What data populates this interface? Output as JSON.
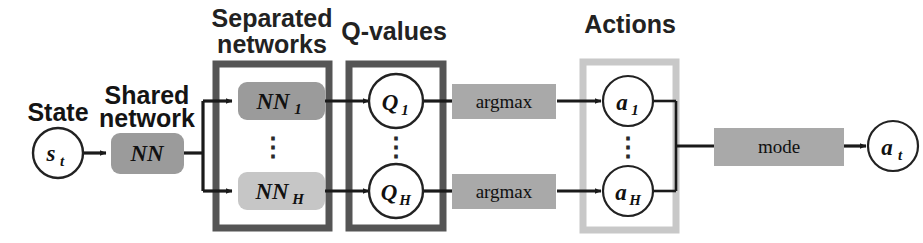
{
  "diagram": {
    "type": "flow-diagram",
    "canvas": {
      "width": 923,
      "height": 243,
      "background": "#ffffff"
    },
    "palette": {
      "ink": "#141414",
      "edge": "#1a1a1a",
      "box_dark_gray": "#9b9b9b",
      "box_light_gray": "#c6c6c6",
      "op_gray": "#a9a9a9",
      "mode_gray": "#a9a9a9",
      "group_border_dark": "#555555",
      "group_border_light": "#c8c8c8",
      "circle_fill": "#ffffff",
      "circle_stroke": "#222222"
    },
    "stage_labels": {
      "state": "State",
      "shared_network": "Shared\nnetwork",
      "shared_network_line1": "Shared",
      "shared_network_line2": "network"
    },
    "group_titles": {
      "separated_networks_line1": "Separated",
      "separated_networks_line2": "networks",
      "q_values": "Q-values",
      "actions": "Actions"
    },
    "nodes": {
      "state_input": {
        "label": "s",
        "sub": "t",
        "shape": "circle"
      },
      "shared_nn": {
        "label": "NN",
        "sub": "",
        "shape": "rounded-rect",
        "fill": "#9b9b9b"
      },
      "branch_networks": [
        {
          "label": "NN",
          "sub": "1",
          "shape": "rounded-rect",
          "fill": "#9b9b9b"
        },
        {
          "label": "NN",
          "sub": "H",
          "shape": "rounded-rect",
          "fill": "#c6c6c6"
        }
      ],
      "q_values": [
        {
          "label": "Q",
          "sub": "1",
          "shape": "circle"
        },
        {
          "label": "Q",
          "sub": "H",
          "shape": "circle"
        }
      ],
      "argmax_ops": [
        {
          "label": "argmax",
          "shape": "rect",
          "fill": "#a9a9a9"
        },
        {
          "label": "argmax",
          "shape": "rect",
          "fill": "#a9a9a9"
        }
      ],
      "actions": [
        {
          "label": "a",
          "sub": "1",
          "shape": "circle"
        },
        {
          "label": "a",
          "sub": "H",
          "shape": "circle"
        }
      ],
      "mode_op": {
        "label": "mode",
        "shape": "rect",
        "fill": "#a9a9a9"
      },
      "action_output": {
        "label": "a",
        "sub": "t",
        "shape": "circle"
      }
    },
    "ellipsis": {
      "glyph": "⋮",
      "occurrences": [
        "separated-networks",
        "q-values",
        "actions"
      ]
    },
    "flow": [
      "State s_t",
      "Shared network NN",
      "Separated networks NN_1 ... NN_H",
      "Q-values Q_1 ... Q_H",
      "argmax",
      "Actions a_1 ... a_H",
      "mode",
      "Action a_t"
    ]
  }
}
